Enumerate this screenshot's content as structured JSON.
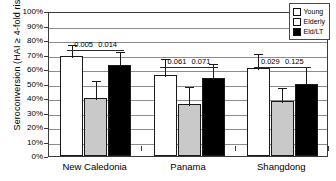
{
  "chart_data": {
    "type": "bar",
    "title": "",
    "xlabel": "",
    "ylabel": "Seroconversion (HAI ≥ 4-fold rise)",
    "categories": [
      "New Caledonia",
      "Panama",
      "Shangdong"
    ],
    "ylim": [
      0,
      100
    ],
    "ytick_labels": [
      "100%",
      "90%",
      "80%",
      "70%",
      "60%",
      "50%",
      "40%",
      "30%",
      "20%",
      "10%",
      "0%"
    ],
    "ytick_values": [
      100,
      90,
      80,
      70,
      60,
      50,
      40,
      30,
      20,
      10,
      0
    ],
    "grid": true,
    "legend_position": "top-right",
    "series": [
      {
        "name": "Young",
        "color": "#ffffff",
        "values": [
          69,
          56,
          61
        ],
        "err_upper": [
          78,
          68,
          72
        ],
        "err_lower": [
          69,
          56,
          61
        ]
      },
      {
        "name": "Elderly",
        "color": "#c9c9c9",
        "values": [
          40,
          36,
          38
        ],
        "err_upper": [
          53,
          49,
          48
        ],
        "err_lower": [
          40,
          36,
          38
        ]
      },
      {
        "name": "Eld/LT",
        "color": "#000000",
        "values": [
          63,
          54,
          50
        ],
        "err_upper": [
          73,
          65,
          63
        ],
        "err_lower": [
          63,
          54,
          50
        ]
      }
    ],
    "annotations": [
      {
        "group": "New Caledonia",
        "pair": "Young vs Elderly",
        "label": "0.005"
      },
      {
        "group": "New Caledonia",
        "pair": "Elderly vs Eld/LT",
        "label": "0.014"
      },
      {
        "group": "Panama",
        "pair": "Young vs Elderly",
        "label": "0.061"
      },
      {
        "group": "Panama",
        "pair": "Elderly vs Eld/LT",
        "label": "0.071"
      },
      {
        "group": "Shangdong",
        "pair": "Young vs Elderly",
        "label": "0.029"
      },
      {
        "group": "Shangdong",
        "pair": "Elderly vs Eld/LT",
        "label": "0.125"
      }
    ]
  },
  "legend": {
    "items": [
      {
        "label": "Young"
      },
      {
        "label": "Elderly"
      },
      {
        "label": "Eld/LT"
      }
    ]
  }
}
